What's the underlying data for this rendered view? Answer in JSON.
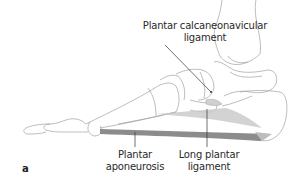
{
  "figure": {
    "panel_label": "a",
    "labels": [
      {
        "id": "plantar-calcaneonavicular",
        "line1": "Plantar calcaneonavicular",
        "line2": "ligament"
      },
      {
        "id": "plantar-aponeurosis",
        "line1": "Plantar",
        "line2": "aponeurosis"
      },
      {
        "id": "long-plantar",
        "line1": "Long plantar",
        "line2": "ligament"
      }
    ],
    "colors": {
      "bone_outline": "#9a9a9a",
      "ligament_fill": "#8c8c8c",
      "leader_line": "#333333",
      "text": "#2a2a2a"
    }
  }
}
